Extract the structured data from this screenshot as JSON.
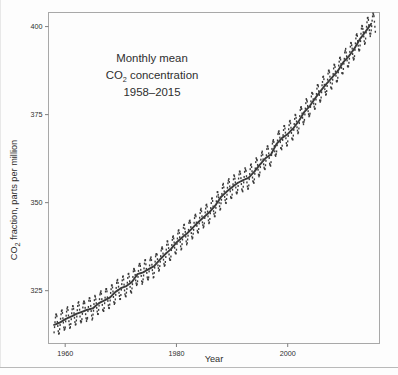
{
  "figure": {
    "kind": "scanned-line-scatter-plot",
    "background_color": "#fdfdfd",
    "ink_color": "#3a3a3a",
    "frame_color": "#a8a8a8"
  },
  "annotation": {
    "line1": "Monthly mean",
    "line2_pre": "CO",
    "line2_sub": "2",
    "line2_post": " concentration",
    "line3": "1958–2015"
  },
  "axes": {
    "ylabel_pre": "CO",
    "ylabel_sub": "2",
    "ylabel_post": " fraction, parts per million",
    "xlabel": "Year"
  },
  "chart_data": {
    "type": "scatter",
    "title": "Monthly mean CO2 concentration 1958–2015",
    "xlabel": "Year",
    "ylabel": "CO2 fraction, parts per million",
    "xlim": [
      1957.0,
      2016.5
    ],
    "ylim": [
      310.0,
      404.0
    ],
    "xticks": [
      1960,
      1980,
      2000
    ],
    "xtick_labels": [
      "1960",
      "1980",
      "2000"
    ],
    "yticks": [
      325,
      350,
      375,
      400
    ],
    "ytick_labels": [
      "325",
      "350",
      "375",
      "400"
    ],
    "grid": false,
    "legend": null,
    "series": [
      {
        "name": "Monthly mean CO2 (Mauna Loa)",
        "marker": "point",
        "color": "#3a3a3a",
        "note": "monthly values include a seasonal cycle of about ±3 ppm peak-to-trough superimposed on the trend",
        "seasonal_amplitude_ppm": 3.0
      },
      {
        "name": "Smooth trend",
        "marker": "line",
        "color": "#3a3a3a",
        "x": [
          1958,
          1959,
          1960,
          1961,
          1962,
          1963,
          1964,
          1965,
          1966,
          1967,
          1968,
          1969,
          1970,
          1971,
          1972,
          1973,
          1974,
          1975,
          1976,
          1977,
          1978,
          1979,
          1980,
          1981,
          1982,
          1983,
          1984,
          1985,
          1986,
          1987,
          1988,
          1989,
          1990,
          1991,
          1992,
          1993,
          1994,
          1995,
          1996,
          1997,
          1998,
          1999,
          2000,
          2001,
          2002,
          2003,
          2004,
          2005,
          2006,
          2007,
          2008,
          2009,
          2010,
          2011,
          2012,
          2013,
          2014,
          2015
        ],
        "values": [
          315.3,
          315.9,
          316.9,
          317.6,
          318.4,
          319.0,
          319.6,
          320.0,
          321.4,
          322.2,
          323.0,
          324.6,
          325.7,
          326.3,
          327.5,
          329.7,
          330.2,
          331.1,
          332.0,
          333.8,
          335.4,
          336.8,
          338.7,
          340.1,
          341.4,
          343.0,
          344.6,
          346.0,
          347.4,
          349.2,
          351.6,
          353.1,
          354.4,
          355.6,
          356.4,
          357.1,
          358.8,
          360.8,
          362.6,
          363.7,
          366.7,
          368.4,
          369.5,
          371.1,
          373.2,
          375.8,
          377.5,
          379.8,
          381.9,
          383.8,
          385.6,
          387.4,
          389.9,
          391.6,
          393.8,
          396.5,
          398.6,
          400.8
        ]
      }
    ]
  }
}
